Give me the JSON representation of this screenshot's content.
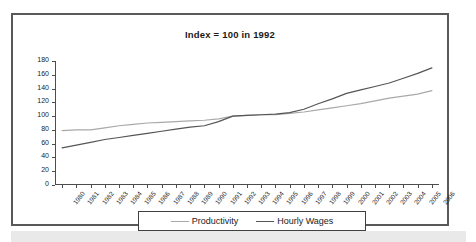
{
  "figure": {
    "border_color": "#595959",
    "background": "#ffffff"
  },
  "legend": {
    "position": "bottom-center",
    "entries": [
      {
        "label": "Productivity",
        "color": "#a9a9a9"
      },
      {
        "label": "Hourly Wages",
        "color": "#555555"
      }
    ]
  },
  "footer": {
    "strip_text": ""
  },
  "chart_data": {
    "type": "line",
    "title": "Index = 100 in 1992",
    "xlabel": "",
    "ylabel": "",
    "ylim": [
      0,
      180
    ],
    "ytick_step": 20,
    "yticks": [
      0,
      20,
      40,
      60,
      80,
      100,
      120,
      140,
      160,
      180
    ],
    "grid": false,
    "legend_position": "bottom-center",
    "x": [
      1980,
      1981,
      1982,
      1983,
      1984,
      1985,
      1986,
      1987,
      1988,
      1989,
      1990,
      1991,
      1992,
      1993,
      1994,
      1995,
      1996,
      1997,
      1998,
      1999,
      2000,
      2001,
      2002,
      2003,
      2004,
      2005,
      2006
    ],
    "categories": [
      "1980",
      "1981",
      "1982",
      "1983",
      "1984",
      "1985",
      "1986",
      "1987",
      "1988",
      "1989",
      "1990",
      "1991",
      "1992",
      "1993",
      "1994",
      "1995",
      "1996",
      "1997",
      "1998",
      "1999",
      "2000",
      "2001",
      "2002",
      "2003",
      "2004",
      "2005",
      "2006"
    ],
    "series": [
      {
        "name": "Productivity",
        "color": "#a9a9a9",
        "values": [
          79,
          80,
          80,
          83,
          86,
          88,
          90,
          91,
          92,
          93,
          94,
          96,
          100,
          101,
          102,
          102,
          104,
          106,
          109,
          112,
          115,
          118,
          122,
          126,
          129,
          132,
          137
        ]
      },
      {
        "name": "Hourly Wages",
        "color": "#555555",
        "values": [
          54,
          58,
          62,
          66,
          69,
          72,
          75,
          78,
          81,
          84,
          86,
          92,
          100,
          101,
          102,
          103,
          105,
          110,
          118,
          125,
          133,
          138,
          143,
          148,
          155,
          162,
          170
        ]
      }
    ]
  }
}
